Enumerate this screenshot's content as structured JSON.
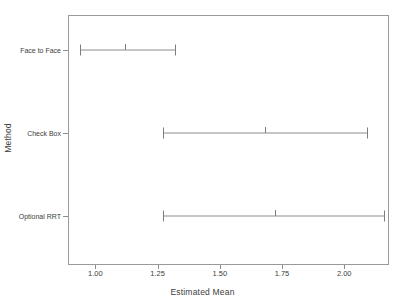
{
  "chart_data": {
    "type": "error_bar",
    "title": "",
    "xlabel": "Estimated Mean",
    "ylabel": "Method",
    "orientation": "horizontal",
    "xlim": [
      0.89,
      2.18
    ],
    "grid": false,
    "legend": "none",
    "xticks": [
      {
        "value": 1.0,
        "label": "1.00"
      },
      {
        "value": 1.25,
        "label": "1.25"
      },
      {
        "value": 1.5,
        "label": "1.50"
      },
      {
        "value": 1.75,
        "label": "1.75"
      },
      {
        "value": 2.0,
        "label": "2.00"
      }
    ],
    "categories": [
      "Face to Face",
      "Check Box",
      "Optional RRT"
    ],
    "series": [
      {
        "name": "Estimated Mean with 95% CI",
        "points": [
          {
            "category": "Face to Face",
            "mean": 1.12,
            "lower": 0.94,
            "upper": 1.32
          },
          {
            "category": "Check Box",
            "mean": 1.68,
            "lower": 1.27,
            "upper": 2.09
          },
          {
            "category": "Optional RRT",
            "mean": 1.72,
            "lower": 1.27,
            "upper": 2.16
          }
        ]
      }
    ]
  },
  "colors": {
    "frame": "#9a9a9a",
    "bar": "#8d8d8d",
    "text": "#3d3d3d",
    "background": "#ffffff"
  }
}
